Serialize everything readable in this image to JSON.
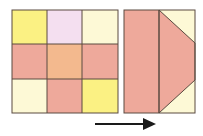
{
  "diagram": {
    "colors": {
      "yellow": "#fbf183",
      "lilac": "#f4dff0",
      "cream": "#fdf9d6",
      "salmon": "#eea99b",
      "peach": "#f3b98e",
      "outline": "#5a4a40",
      "arrow": "#1a1a1a"
    },
    "grid": {
      "rows": 3,
      "cols": 3,
      "cells": [
        [
          "yellow",
          "lilac",
          "cream"
        ],
        [
          "salmon",
          "peach",
          "salmon"
        ],
        [
          "cream",
          "salmon",
          "yellow"
        ]
      ]
    },
    "result_block": {
      "left_piece": "salmon",
      "pentagon": "salmon",
      "corner_triangles": "cream"
    },
    "arrow": {
      "direction": "right"
    }
  }
}
